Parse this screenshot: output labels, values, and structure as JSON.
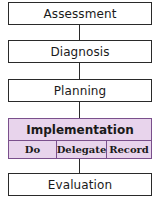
{
  "diagram": {
    "steps": [
      {
        "label": "Assessment"
      },
      {
        "label": "Diagnosis"
      },
      {
        "label": "Planning"
      },
      {
        "label": "Implementation",
        "sub_steps": [
          "Do",
          "Delegate",
          "Record"
        ]
      },
      {
        "label": "Evaluation"
      }
    ],
    "colors": {
      "box_border": "#2a2a2a",
      "implementation_fill": "#e8d4ec",
      "implementation_border": "#7a4f8c"
    }
  }
}
